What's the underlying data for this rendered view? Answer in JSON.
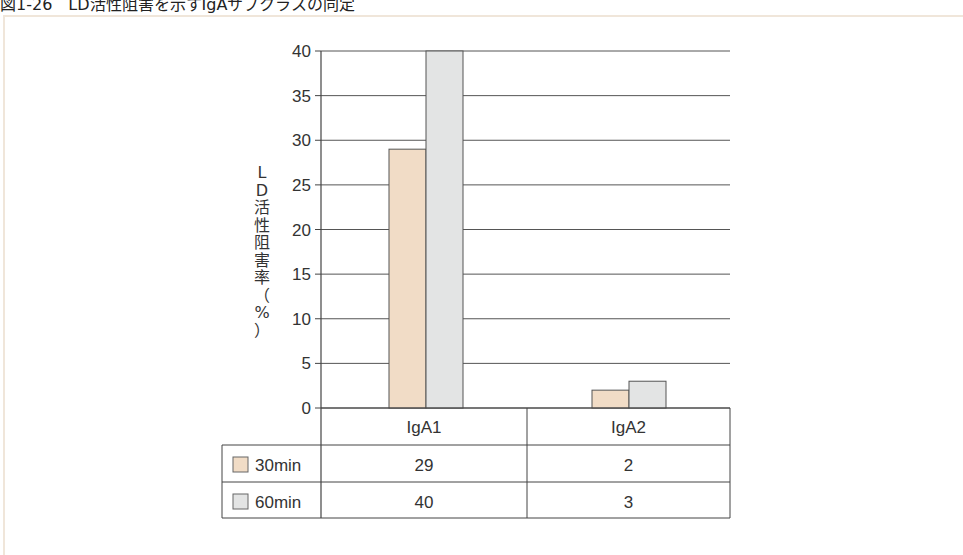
{
  "figure": {
    "title": "図1-26　LD活性阻害を示すIgAサブクラスの同定"
  },
  "chart_data": {
    "type": "bar",
    "title": "図1-26　LD活性阻害を示すIgAサブクラスの同定",
    "xlabel": "",
    "ylabel": "LD活性阻害率（%）",
    "ylabel_chars": [
      "L",
      "D",
      "活",
      "性",
      "阻",
      "害",
      "率",
      "（",
      "%",
      "）"
    ],
    "categories": [
      "IgA1",
      "IgA2"
    ],
    "series": [
      {
        "name": "30min",
        "values": [
          29,
          2
        ],
        "color": "#f1dcc6"
      },
      {
        "name": "60min",
        "values": [
          40,
          3
        ],
        "color": "#e3e4e4"
      }
    ],
    "ylim": [
      0,
      40
    ],
    "yticks": [
      "0",
      "5",
      "10",
      "15",
      "20",
      "25",
      "30",
      "35",
      "40"
    ],
    "grid": true,
    "legend_position": "data-table-below",
    "data_table": {
      "header": [
        "IgA1",
        "IgA2"
      ],
      "rows": [
        {
          "label": "30min",
          "values": [
            "29",
            "2"
          ]
        },
        {
          "label": "60min",
          "values": [
            "40",
            "3"
          ]
        }
      ]
    }
  }
}
